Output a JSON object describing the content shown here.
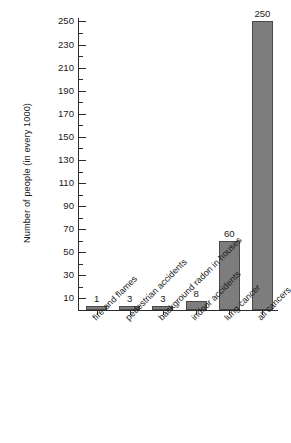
{
  "chart_data": {
    "type": "bar",
    "title": "",
    "xlabel": "",
    "ylabel": "Number of people (in every 1000)",
    "categories": [
      "fire and flames",
      "pedestrian accidents",
      "background radon in houses",
      "indoor accidents",
      "lung cancer",
      "all cancers"
    ],
    "values": [
      1,
      3,
      3,
      8,
      60,
      250
    ],
    "value_labels": [
      "1",
      "3",
      "3",
      "8",
      "60",
      "250"
    ],
    "ylim": [
      0,
      253
    ],
    "y_major_ticks": [
      10,
      30,
      50,
      70,
      90,
      110,
      130,
      150,
      170,
      190,
      210,
      230,
      250
    ],
    "y_major_tick_labels": [
      "10",
      "30",
      "50",
      "70",
      "90",
      "110",
      "130",
      "150",
      "170",
      "190",
      "210",
      "230",
      "250"
    ],
    "y_minor_ticks": [
      20,
      40,
      60,
      80,
      100,
      120,
      140,
      160,
      180,
      200,
      220,
      240
    ],
    "grid": false,
    "legend": null,
    "bar_color": "#7d7d7d",
    "bar_edge_color": "#4a4a4a",
    "axis_color": "#2b2b2b",
    "background_color": "#ffffff",
    "x_tick_label_rotation": -45
  }
}
